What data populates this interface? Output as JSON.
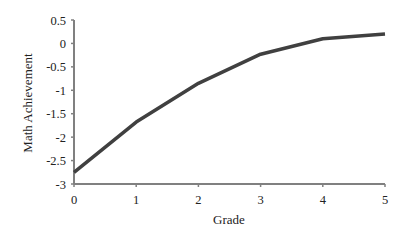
{
  "chart_data": {
    "type": "line",
    "title": "",
    "xlabel": "Grade",
    "ylabel": "Math Achievement",
    "x": [
      0,
      1,
      2,
      3,
      4,
      5
    ],
    "series": [
      {
        "name": "Math Achievement",
        "values": [
          -2.75,
          -1.68,
          -0.85,
          -0.23,
          0.1,
          0.2
        ],
        "color": "#404040"
      }
    ],
    "xlim": [
      0,
      5
    ],
    "ylim": [
      -3,
      0.5
    ],
    "xticks": [
      "0",
      "1",
      "2",
      "3",
      "4",
      "5"
    ],
    "yticks": [
      "0.5",
      "0",
      "-0.5",
      "-1",
      "-1.5",
      "-2",
      "-2.5",
      "-3"
    ],
    "grid": false,
    "legend": null
  },
  "colors": {
    "axis": "#808080",
    "line": "#404040",
    "text": "#222222"
  }
}
